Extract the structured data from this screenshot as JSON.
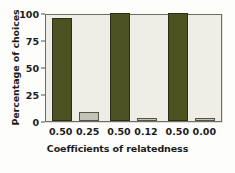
{
  "chart_data": {
    "type": "bar",
    "title": "",
    "subtitle": "",
    "xlabel": "Coefficients of relatedness",
    "ylabel": "Percentage of choices",
    "categories": [
      "0.50",
      "0.25",
      "0.50",
      "0.12",
      "0.50",
      "0.00"
    ],
    "values": [
      95,
      8,
      100,
      3,
      100,
      3
    ],
    "bar_colors": [
      "#4c5222",
      "#c3c3b7",
      "#4c5222",
      "#c3c3b7",
      "#4c5222",
      "#c3c3b7"
    ],
    "ylim": [
      0,
      100
    ],
    "yticks": [
      0,
      25,
      50,
      75,
      100
    ],
    "ytick_labels": [
      "0",
      "25",
      "50",
      "75",
      "100"
    ],
    "grid": false,
    "legend": null,
    "legend_position": "none",
    "annotations": [],
    "pairs": [
      {
        "left": "0.50",
        "right": "0.25"
      },
      {
        "left": "0.50",
        "right": "0.12"
      },
      {
        "left": "0.50",
        "right": "0.00"
      }
    ]
  },
  "style": {
    "plot_background": "#eeeee6",
    "frame_color": "#6f6c61",
    "dark_bar_color": "#4c5222",
    "light_bar_color": "#c3c3b7",
    "text_color": "#1b1b1b",
    "page_background": "#fdfdfb"
  }
}
